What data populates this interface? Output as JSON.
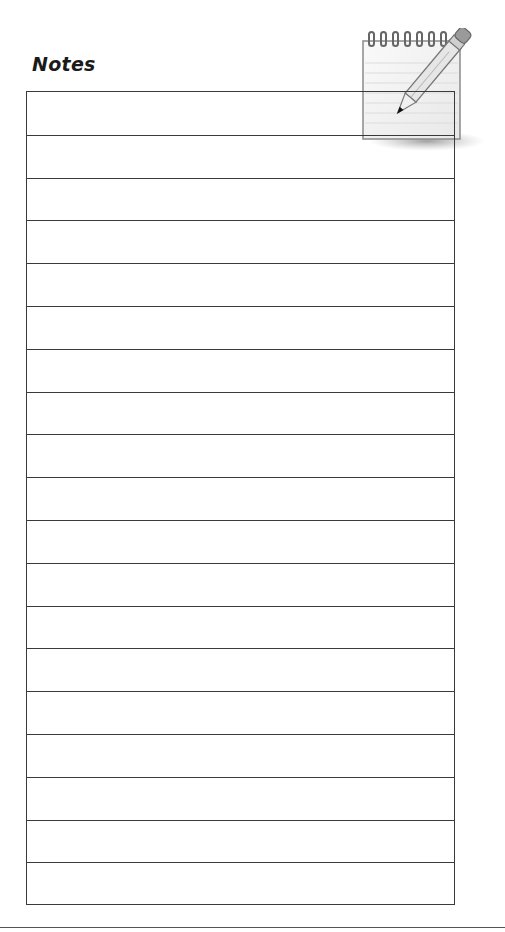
{
  "page": {
    "title": "Notes",
    "icon": "notepad-pencil-icon",
    "line_count": 19
  },
  "colors": {
    "line": "#3a3a3a",
    "title": "#1a1a1a"
  }
}
